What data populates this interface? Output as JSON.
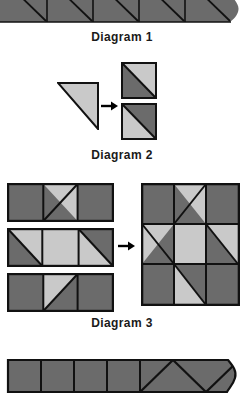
{
  "document": {
    "type": "quilting-instruction-diagram",
    "page_background": "#ffffff"
  },
  "palette": {
    "dark_fabric": "#6b6b6b",
    "light_fabric": "#c9c9c9",
    "outline": "#111111",
    "text": "#1a1a1a",
    "arrow": "#000000"
  },
  "captions": {
    "diagram1": "Diagram 1",
    "diagram2": "Diagram 2",
    "diagram3": "Diagram 3"
  },
  "sections": {
    "top_strip": {
      "name": "diagram-1-strip",
      "cropped": true,
      "description": "Row of dark squares each crossed by a diagonal seam line, cut off at top of page",
      "segments": 5,
      "fill": "#6b6b6b",
      "diagonal_direction": "top-left-to-bottom-right"
    },
    "diagram2": {
      "name": "diagram-2",
      "source_piece": {
        "shape": "right-triangle",
        "fill": "#c9c9c9",
        "label": "light triangle"
      },
      "arrow": "right-arrow",
      "results": [
        {
          "name": "half-square-unit-a",
          "dark_position": "lower-left",
          "light_position": "upper-right",
          "diagonal": "top-left-to-bottom-right"
        },
        {
          "name": "half-square-unit-b",
          "dark_position": "upper-right",
          "light_position": "lower-left",
          "diagonal": "top-left-to-bottom-right"
        }
      ]
    },
    "diagram3": {
      "name": "diagram-3",
      "rows": [
        {
          "name": "row-1",
          "cells": [
            {
              "type": "solid",
              "fill": "dark"
            },
            {
              "type": "hst",
              "dark": "upper-left",
              "light": "lower-right"
            },
            {
              "type": "solid",
              "fill": "dark"
            }
          ]
        },
        {
          "name": "row-2",
          "cells": [
            {
              "type": "hst",
              "dark": "lower-left",
              "light": "upper-right"
            },
            {
              "type": "solid",
              "fill": "light"
            },
            {
              "type": "hst",
              "dark": "upper-right",
              "light": "lower-left"
            }
          ]
        },
        {
          "name": "row-3",
          "cells": [
            {
              "type": "solid",
              "fill": "dark"
            },
            {
              "type": "hst",
              "dark": "lower-right",
              "light": "upper-left"
            },
            {
              "type": "solid",
              "fill": "dark"
            }
          ]
        }
      ],
      "arrow": "right-arrow",
      "assembled_block": {
        "name": "friendship-star-block",
        "grid": "3x3",
        "description": "Three rows joined into a pinwheel star block"
      }
    },
    "bottom_strip": {
      "name": "bottom-strip",
      "cropped": true,
      "plain_squares": 4,
      "zigzag_triangles": 4,
      "fill": "#6b6b6b",
      "description": "Row of dark squares followed by zigzag seam triangles, cut off at page edge"
    }
  }
}
